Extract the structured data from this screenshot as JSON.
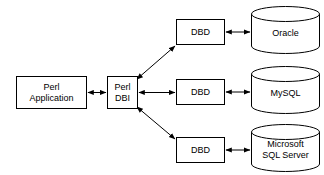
{
  "diagram": {
    "background_color": "#ffffff",
    "stroke_color": "#000000",
    "fill_color": "#ffffff",
    "text_color": "#000000",
    "nodes": {
      "perl_application": {
        "label_line1": "Perl",
        "label_line2": "Application",
        "shape": "rectangle"
      },
      "perl_dbi": {
        "label_line1": "Perl",
        "label_line2": "DBI",
        "shape": "rectangle"
      },
      "dbd_oracle": {
        "label_line1": "DBD",
        "shape": "rectangle"
      },
      "dbd_mysql": {
        "label_line1": "DBD",
        "shape": "rectangle"
      },
      "dbd_mssql": {
        "label_line1": "DBD",
        "shape": "rectangle"
      },
      "oracle_db": {
        "label_line1": "Oracle",
        "shape": "cylinder"
      },
      "mysql_db": {
        "label_line1": "MySQL",
        "shape": "cylinder"
      },
      "mssql_db": {
        "label_line1": "Microsoft",
        "label_line2": "SQL Server",
        "shape": "cylinder"
      }
    },
    "connectors": [
      {
        "name": "app-to-dbi",
        "from": "perl_application",
        "to": "perl_dbi",
        "style": "double-arrow-horizontal"
      },
      {
        "name": "dbi-to-dbd-oracle",
        "from": "perl_dbi",
        "to": "dbd_oracle",
        "style": "double-arrow-diagonal-up"
      },
      {
        "name": "dbi-to-dbd-mysql",
        "from": "perl_dbi",
        "to": "dbd_mysql",
        "style": "double-arrow-horizontal"
      },
      {
        "name": "dbi-to-dbd-mssql",
        "from": "perl_dbi",
        "to": "dbd_mssql",
        "style": "double-arrow-diagonal-down"
      },
      {
        "name": "dbd-to-oracle-db",
        "from": "dbd_oracle",
        "to": "oracle_db",
        "style": "double-arrow-horizontal"
      },
      {
        "name": "dbd-to-mysql-db",
        "from": "dbd_mysql",
        "to": "mysql_db",
        "style": "double-arrow-horizontal"
      },
      {
        "name": "dbd-to-mssql-db",
        "from": "dbd_mssql",
        "to": "mssql_db",
        "style": "double-arrow-horizontal"
      }
    ]
  }
}
